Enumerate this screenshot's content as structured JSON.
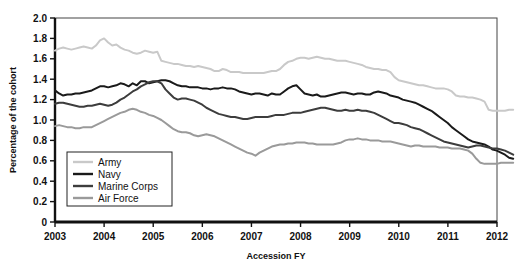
{
  "chart_data": {
    "type": "line",
    "title": "",
    "xlabel": "Accession FY",
    "ylabel": "Percentage of the cohort",
    "xlim": [
      2003,
      2012
    ],
    "ylim": [
      0,
      2.0
    ],
    "xticks": [
      "2003",
      "2004",
      "2005",
      "2006",
      "2007",
      "2008",
      "2009",
      "2010",
      "2011",
      "2012"
    ],
    "yticks": [
      "0",
      "0.2",
      "0.4",
      "0.6",
      "0.8",
      "1.0",
      "1.2",
      "1.4",
      "1.6",
      "1.8",
      "2.0"
    ],
    "grid": false,
    "legend_position": "lower-left-inside",
    "x_start": 2003.0,
    "x_end": 2011.67,
    "x_step": 0.0833,
    "series": [
      {
        "name": "Army",
        "color": "#c9c9c9",
        "width": 2.0,
        "values": [
          1.68,
          1.7,
          1.71,
          1.7,
          1.69,
          1.7,
          1.71,
          1.72,
          1.71,
          1.7,
          1.73,
          1.78,
          1.8,
          1.76,
          1.73,
          1.74,
          1.71,
          1.69,
          1.68,
          1.66,
          1.65,
          1.66,
          1.68,
          1.67,
          1.66,
          1.67,
          1.58,
          1.57,
          1.56,
          1.55,
          1.55,
          1.54,
          1.53,
          1.53,
          1.52,
          1.53,
          1.52,
          1.51,
          1.5,
          1.48,
          1.48,
          1.5,
          1.49,
          1.47,
          1.47,
          1.47,
          1.46,
          1.46,
          1.46,
          1.46,
          1.46,
          1.46,
          1.47,
          1.48,
          1.48,
          1.5,
          1.54,
          1.57,
          1.58,
          1.6,
          1.61,
          1.61,
          1.6,
          1.61,
          1.62,
          1.61,
          1.6,
          1.6,
          1.59,
          1.58,
          1.58,
          1.58,
          1.57,
          1.56,
          1.55,
          1.54,
          1.52,
          1.51,
          1.5,
          1.5,
          1.49,
          1.49,
          1.47,
          1.42,
          1.39,
          1.38,
          1.37,
          1.36,
          1.35,
          1.34,
          1.34,
          1.33,
          1.32,
          1.31,
          1.31,
          1.31,
          1.3,
          1.28,
          1.24,
          1.23,
          1.23,
          1.22,
          1.22,
          1.21,
          1.2,
          1.18,
          1.1,
          1.09,
          1.09,
          1.09,
          1.09,
          1.1,
          1.1
        ]
      },
      {
        "name": "Navy",
        "color": "#1a1a1a",
        "width": 2.0,
        "values": [
          1.29,
          1.26,
          1.24,
          1.25,
          1.25,
          1.26,
          1.26,
          1.27,
          1.28,
          1.29,
          1.31,
          1.33,
          1.33,
          1.32,
          1.33,
          1.34,
          1.36,
          1.35,
          1.33,
          1.36,
          1.34,
          1.38,
          1.38,
          1.36,
          1.37,
          1.38,
          1.39,
          1.39,
          1.38,
          1.36,
          1.34,
          1.33,
          1.33,
          1.32,
          1.32,
          1.32,
          1.31,
          1.31,
          1.3,
          1.31,
          1.31,
          1.32,
          1.31,
          1.31,
          1.3,
          1.28,
          1.27,
          1.26,
          1.25,
          1.26,
          1.26,
          1.25,
          1.24,
          1.26,
          1.25,
          1.25,
          1.28,
          1.31,
          1.33,
          1.34,
          1.3,
          1.26,
          1.25,
          1.24,
          1.25,
          1.23,
          1.23,
          1.24,
          1.25,
          1.26,
          1.27,
          1.27,
          1.26,
          1.25,
          1.26,
          1.26,
          1.25,
          1.25,
          1.27,
          1.28,
          1.27,
          1.26,
          1.24,
          1.23,
          1.22,
          1.2,
          1.19,
          1.18,
          1.17,
          1.15,
          1.13,
          1.11,
          1.09,
          1.06,
          1.03,
          1.0,
          0.97,
          0.93,
          0.9,
          0.87,
          0.84,
          0.81,
          0.79,
          0.78,
          0.77,
          0.76,
          0.74,
          0.71,
          0.7,
          0.68,
          0.66,
          0.63,
          0.62
        ]
      },
      {
        "name": "Marine Corps",
        "color": "#3d3d3d",
        "width": 2.0,
        "values": [
          1.16,
          1.17,
          1.17,
          1.16,
          1.15,
          1.14,
          1.13,
          1.13,
          1.14,
          1.14,
          1.15,
          1.16,
          1.15,
          1.14,
          1.15,
          1.17,
          1.2,
          1.22,
          1.25,
          1.28,
          1.3,
          1.33,
          1.35,
          1.37,
          1.38,
          1.38,
          1.36,
          1.3,
          1.26,
          1.22,
          1.2,
          1.21,
          1.21,
          1.2,
          1.19,
          1.17,
          1.15,
          1.12,
          1.1,
          1.08,
          1.06,
          1.05,
          1.04,
          1.03,
          1.03,
          1.02,
          1.01,
          1.01,
          1.02,
          1.03,
          1.03,
          1.03,
          1.03,
          1.04,
          1.05,
          1.05,
          1.05,
          1.06,
          1.07,
          1.07,
          1.07,
          1.08,
          1.09,
          1.1,
          1.11,
          1.12,
          1.12,
          1.11,
          1.1,
          1.09,
          1.09,
          1.1,
          1.09,
          1.09,
          1.1,
          1.09,
          1.09,
          1.08,
          1.07,
          1.05,
          1.03,
          1.01,
          0.99,
          0.97,
          0.97,
          0.96,
          0.95,
          0.93,
          0.92,
          0.91,
          0.89,
          0.87,
          0.85,
          0.83,
          0.81,
          0.79,
          0.78,
          0.77,
          0.76,
          0.75,
          0.74,
          0.73,
          0.74,
          0.75,
          0.75,
          0.74,
          0.73,
          0.72,
          0.72,
          0.71,
          0.7,
          0.68,
          0.66
        ]
      },
      {
        "name": "Air Force",
        "color": "#9a9a9a",
        "width": 2.0,
        "values": [
          0.94,
          0.95,
          0.94,
          0.93,
          0.93,
          0.92,
          0.92,
          0.93,
          0.93,
          0.93,
          0.95,
          0.97,
          0.99,
          1.01,
          1.03,
          1.05,
          1.07,
          1.08,
          1.1,
          1.11,
          1.1,
          1.08,
          1.07,
          1.05,
          1.04,
          1.02,
          1.0,
          0.97,
          0.94,
          0.91,
          0.89,
          0.88,
          0.88,
          0.87,
          0.85,
          0.84,
          0.85,
          0.86,
          0.85,
          0.84,
          0.82,
          0.8,
          0.78,
          0.76,
          0.74,
          0.72,
          0.7,
          0.68,
          0.67,
          0.65,
          0.68,
          0.7,
          0.72,
          0.74,
          0.75,
          0.76,
          0.76,
          0.77,
          0.77,
          0.78,
          0.78,
          0.78,
          0.77,
          0.77,
          0.76,
          0.76,
          0.76,
          0.76,
          0.76,
          0.77,
          0.78,
          0.8,
          0.81,
          0.81,
          0.82,
          0.81,
          0.81,
          0.8,
          0.8,
          0.8,
          0.79,
          0.79,
          0.79,
          0.78,
          0.77,
          0.76,
          0.75,
          0.74,
          0.75,
          0.75,
          0.74,
          0.74,
          0.74,
          0.74,
          0.73,
          0.73,
          0.73,
          0.72,
          0.72,
          0.72,
          0.71,
          0.7,
          0.67,
          0.62,
          0.58,
          0.57,
          0.57,
          0.57,
          0.57,
          0.58,
          0.58,
          0.58,
          0.58
        ]
      }
    ]
  }
}
